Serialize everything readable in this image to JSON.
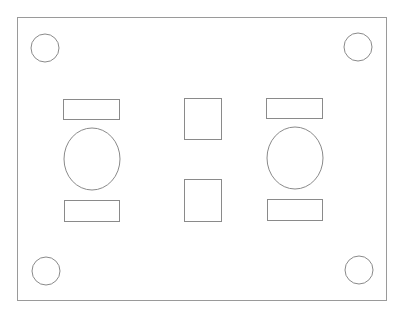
{
  "drawing": {
    "title": "Panel layout drawing",
    "stroke_color": "#8a8a8a",
    "background_color": "#ffffff",
    "elements": [
      {
        "kind": "outer-panel"
      },
      {
        "kind": "mounting-hole",
        "corner": "top-left"
      },
      {
        "kind": "mounting-hole",
        "corner": "top-right"
      },
      {
        "kind": "mounting-hole",
        "corner": "bottom-left"
      },
      {
        "kind": "mounting-hole",
        "corner": "bottom-right"
      },
      {
        "kind": "slot",
        "group": "left",
        "position": "top"
      },
      {
        "kind": "oval-cutout",
        "group": "left"
      },
      {
        "kind": "slot",
        "group": "left",
        "position": "bottom"
      },
      {
        "kind": "square-cutout",
        "group": "center",
        "position": "top"
      },
      {
        "kind": "square-cutout",
        "group": "center",
        "position": "bottom"
      },
      {
        "kind": "slot",
        "group": "right",
        "position": "top"
      },
      {
        "kind": "oval-cutout",
        "group": "right"
      },
      {
        "kind": "slot",
        "group": "right",
        "position": "bottom"
      }
    ]
  }
}
